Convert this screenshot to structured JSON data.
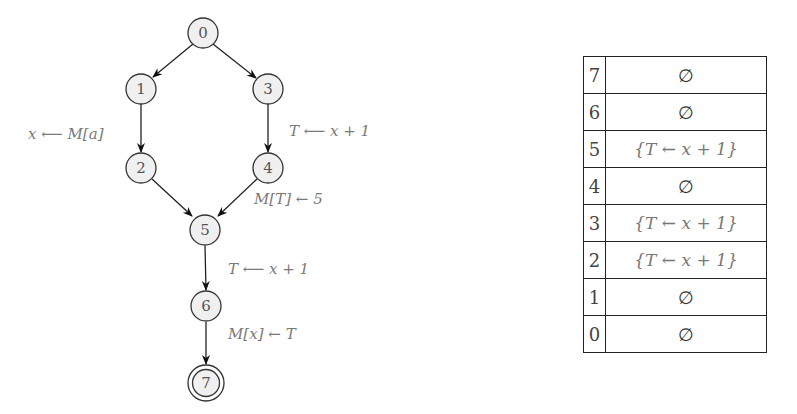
{
  "graph": {
    "nodes": [
      {
        "id": "0",
        "label": "0",
        "x": 203,
        "y": 33
      },
      {
        "id": "1",
        "label": "1",
        "x": 141,
        "y": 89
      },
      {
        "id": "2",
        "label": "2",
        "x": 141,
        "y": 168
      },
      {
        "id": "3",
        "label": "3",
        "x": 268,
        "y": 89
      },
      {
        "id": "4",
        "label": "4",
        "x": 268,
        "y": 168
      },
      {
        "id": "5",
        "label": "5",
        "x": 205,
        "y": 230
      },
      {
        "id": "6",
        "label": "6",
        "x": 206,
        "y": 306
      },
      {
        "id": "7",
        "label": "7",
        "x": 206,
        "y": 383,
        "final": true
      }
    ],
    "edges": [
      {
        "from": "0",
        "to": "1",
        "label": ""
      },
      {
        "from": "0",
        "to": "3",
        "label": ""
      },
      {
        "from": "1",
        "to": "2",
        "label": "x ⟵ M[a]"
      },
      {
        "from": "3",
        "to": "4",
        "label": "T ⟵ x + 1"
      },
      {
        "from": "2",
        "to": "5",
        "label": ""
      },
      {
        "from": "4",
        "to": "5",
        "label": "M[T] ← 5"
      },
      {
        "from": "5",
        "to": "6",
        "label": "T ⟵ x + 1"
      },
      {
        "from": "6",
        "to": "7",
        "label": "M[x] ← T"
      }
    ],
    "edge_labels": {
      "e12": "x ⟵ M[a]",
      "e34": "T ⟵ x + 1",
      "e45": "M[T] ← 5",
      "e56": "T ⟵ x + 1",
      "e67": "M[x] ← T"
    }
  },
  "table": {
    "rows": [
      {
        "index": "7",
        "value": "∅"
      },
      {
        "index": "6",
        "value": "∅"
      },
      {
        "index": "5",
        "value": "{T ← x + 1}"
      },
      {
        "index": "4",
        "value": "∅"
      },
      {
        "index": "3",
        "value": "{T ← x + 1}"
      },
      {
        "index": "2",
        "value": "{T ← x + 1}"
      },
      {
        "index": "1",
        "value": "∅"
      },
      {
        "index": "0",
        "value": "∅"
      }
    ]
  }
}
